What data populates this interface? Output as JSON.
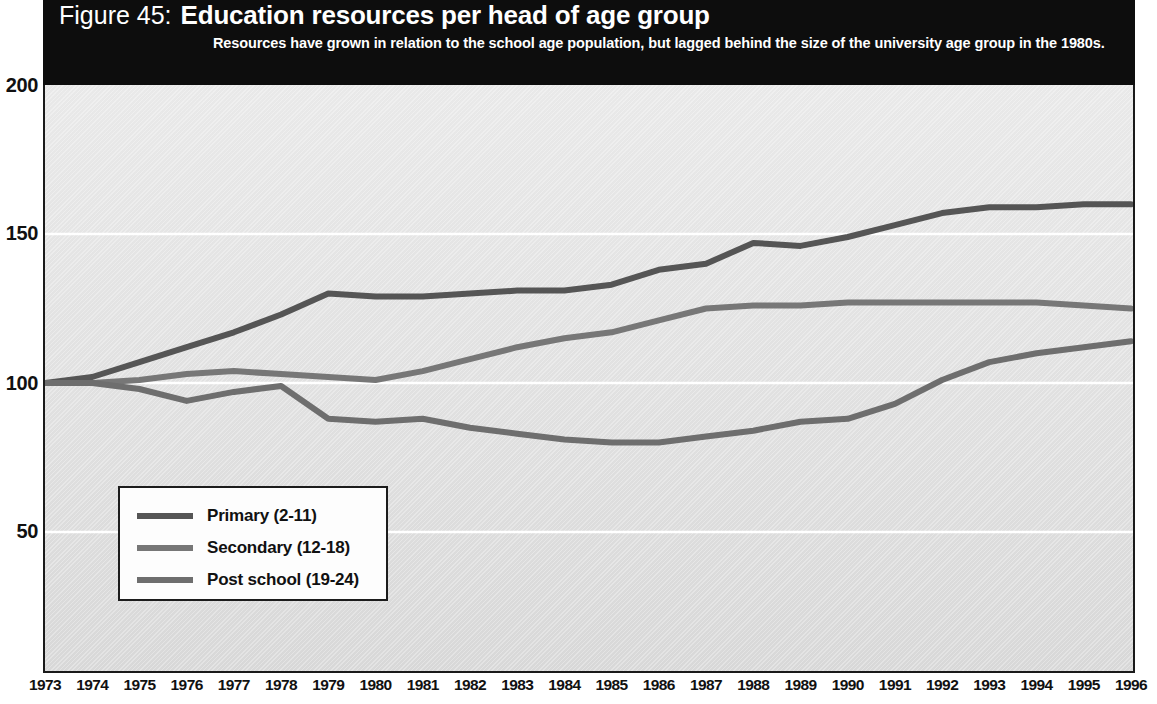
{
  "figure": {
    "number_label": "Figure 45:",
    "title": "Education resources per head of age group",
    "subtitle": "Resources have grown in relation to the school age population, but lagged behind the size of the university age group in the 1980s."
  },
  "legend": {
    "position": "inside-bottom-left",
    "items": [
      {
        "label": "Primary (2-11)",
        "color": "#555555"
      },
      {
        "label": "Secondary (12-18)",
        "color": "#777777"
      },
      {
        "label": "Post school (19-24)",
        "color": "#6e6e6e"
      }
    ]
  },
  "axes": {
    "y_ticks": [
      "200",
      "150",
      "100",
      "50"
    ],
    "y_tick_values": [
      200,
      150,
      100,
      50
    ],
    "x_first": "1973",
    "x_last": "1996"
  },
  "chart_data": {
    "type": "line",
    "title": "Education resources per head of age group",
    "subtitle": "Resources have grown in relation to the school age population, but lagged behind the size of the university age group in the 1980s.",
    "xlabel": "",
    "ylabel": "",
    "ylim": [
      0,
      200
    ],
    "grid": true,
    "grid_axis": "y",
    "legend_position": "inside-bottom-left",
    "x": [
      1973,
      1974,
      1975,
      1976,
      1977,
      1978,
      1979,
      1980,
      1981,
      1982,
      1983,
      1984,
      1985,
      1986,
      1987,
      1988,
      1989,
      1990,
      1991,
      1992,
      1993,
      1994,
      1995,
      1996
    ],
    "categories": [
      "1973",
      "1974",
      "1975",
      "1976",
      "1977",
      "1978",
      "1979",
      "1980",
      "1981",
      "1982",
      "1983",
      "1984",
      "1985",
      "1986",
      "1987",
      "1988",
      "1989",
      "1990",
      "1991",
      "1992",
      "1993",
      "1994",
      "1995",
      "1996"
    ],
    "series": [
      {
        "name": "Primary (2-11)",
        "color": "#555555",
        "values": [
          100,
          102,
          107,
          112,
          117,
          123,
          130,
          129,
          129,
          130,
          131,
          131,
          133,
          138,
          140,
          147,
          146,
          149,
          153,
          157,
          159,
          159,
          160,
          160
        ]
      },
      {
        "name": "Secondary (12-18)",
        "color": "#777777",
        "values": [
          100,
          100,
          101,
          103,
          104,
          103,
          102,
          101,
          104,
          108,
          112,
          115,
          117,
          121,
          125,
          126,
          126,
          127,
          127,
          127,
          127,
          127,
          126,
          125
        ]
      },
      {
        "name": "Post school (19-24)",
        "color": "#6e6e6e",
        "values": [
          100,
          100,
          98,
          94,
          97,
          99,
          88,
          87,
          88,
          85,
          83,
          81,
          80,
          80,
          82,
          84,
          87,
          88,
          93,
          101,
          107,
          110,
          112,
          114
        ]
      }
    ]
  }
}
